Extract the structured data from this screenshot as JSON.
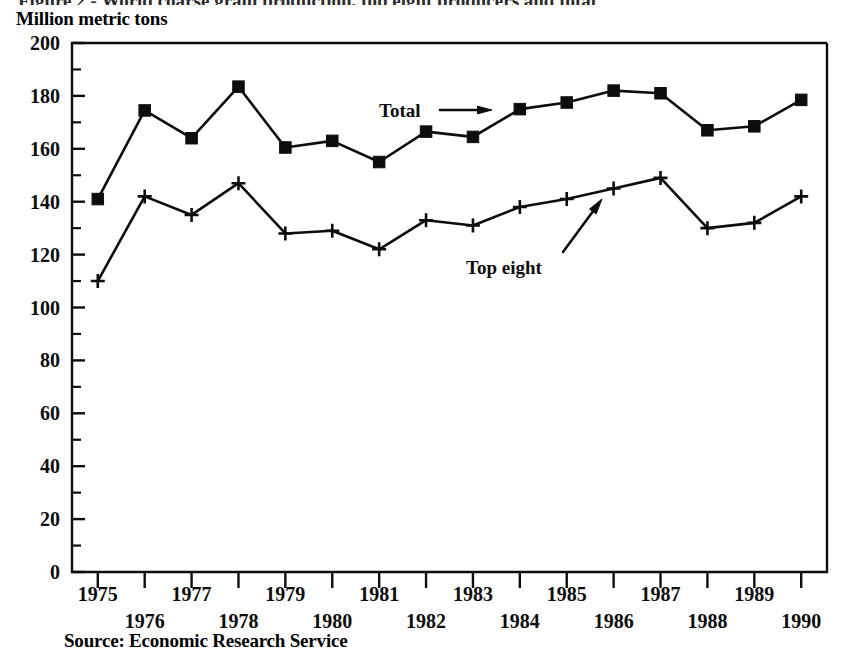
{
  "figure": {
    "clipped_title": "Figure 2 - World coarse grain production, top eight producers and total",
    "axis_title": "Million metric tons",
    "source_note": "Source: Economic Research Service"
  },
  "chart_data": {
    "type": "line",
    "title": "",
    "xlabel": "",
    "ylabel": "Million metric tons",
    "categories": [
      "1975",
      "1976",
      "1977",
      "1978",
      "1979",
      "1980",
      "1981",
      "1982",
      "1983",
      "1984",
      "1985",
      "1986",
      "1987",
      "1988",
      "1989",
      "1990"
    ],
    "ylim": [
      0,
      200
    ],
    "ytick_labels": [
      "0",
      "20",
      "40",
      "60",
      "80",
      "100",
      "120",
      "140",
      "160",
      "180",
      "200"
    ],
    "ytick_values": [
      0,
      20,
      40,
      60,
      80,
      100,
      120,
      140,
      160,
      180,
      200
    ],
    "yminor_step": 10,
    "grid": false,
    "legend_position": "inline-annotations",
    "series": [
      {
        "name": "Total",
        "marker": "filled-square",
        "label_text": "Total",
        "values": [
          141,
          174.5,
          164,
          183.5,
          160.5,
          163,
          155,
          166.5,
          164.5,
          175,
          177.5,
          182,
          181,
          167,
          168.5,
          178.5
        ]
      },
      {
        "name": "Top eight",
        "marker": "plus",
        "label_text": "Top eight",
        "values": [
          110,
          142,
          135,
          147,
          128,
          129,
          122,
          133,
          131,
          138,
          141,
          145,
          149,
          130,
          132,
          142
        ]
      }
    ],
    "annotations": [
      {
        "text": "Total",
        "points_to": "total-series",
        "arrow": "right"
      },
      {
        "text": "Top eight",
        "points_to": "top-eight-series",
        "arrow": "up-right"
      }
    ]
  },
  "colors": {
    "ink": "#0d0d0d",
    "background": "#ffffff"
  }
}
